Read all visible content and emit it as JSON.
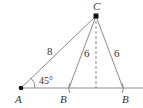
{
  "diagram": {
    "type": "geometry-triangle-ambiguous-case",
    "points": {
      "A": {
        "label": "A"
      },
      "B1": {
        "label": "B"
      },
      "B2": {
        "label": "B"
      },
      "C": {
        "label": "C"
      }
    },
    "sides": {
      "AC": "8",
      "CB1": "6",
      "CB2": "6"
    },
    "angle_A": "45°",
    "colors": {
      "line": "#8a8a8a",
      "point": "#111111",
      "text": "#333333"
    }
  }
}
